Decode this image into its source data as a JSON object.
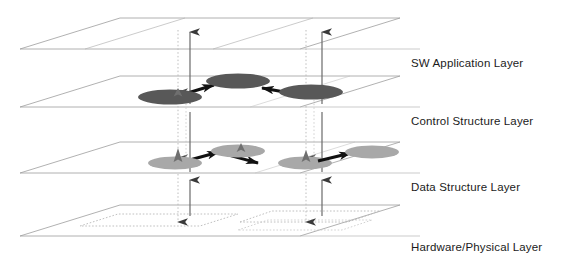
{
  "diagram": {
    "title_present": false,
    "type": "layered-architecture-3d",
    "background_color": "#ffffff",
    "plane_stroke": "#9a9a9a",
    "plane_fill": "#ffffff",
    "dotted_stroke": "#b0b0b0",
    "connector_stroke": "#4d4d4d",
    "arrow_black": "#111111",
    "control_node_color": "#585858",
    "data_node_color": "#a8a8a8",
    "layers": [
      {
        "id": "sw-application",
        "label": "SW Application Layer",
        "order": 0,
        "back_edge_y": 18,
        "front_edge_y": 49,
        "nodes": 0
      },
      {
        "id": "control-structure",
        "label": "Control Structure Layer",
        "order": 1,
        "back_edge_y": 76,
        "front_edge_y": 107,
        "nodes": 3,
        "node_color": "#585858"
      },
      {
        "id": "data-structure",
        "label": "Data Structure Layer",
        "order": 2,
        "back_edge_y": 142,
        "front_edge_y": 173,
        "nodes": 4,
        "node_color": "#a8a8a8"
      },
      {
        "id": "hardware-physical",
        "label": "Hardware/Physical  Layer",
        "order": 3,
        "back_edge_y": 205,
        "front_edge_y": 236,
        "nodes": 0,
        "dotted_regions": 2
      }
    ],
    "control_nodes": [
      {
        "id": "c1",
        "cx": 170,
        "cy": 97,
        "rx": 32,
        "ry": 7.5
      },
      {
        "id": "c2",
        "cx": 238,
        "cy": 81,
        "rx": 32,
        "ry": 7.5
      },
      {
        "id": "c3",
        "cx": 311,
        "cy": 92,
        "rx": 32,
        "ry": 7.5
      }
    ],
    "data_nodes": [
      {
        "id": "d1",
        "cx": 175,
        "cy": 163,
        "rx": 27,
        "ry": 6.5
      },
      {
        "id": "d2",
        "cx": 238,
        "cy": 151,
        "rx": 27,
        "ry": 6.5
      },
      {
        "id": "d3",
        "cx": 305,
        "cy": 163,
        "rx": 27,
        "ry": 6.5
      },
      {
        "id": "d4",
        "cx": 372,
        "cy": 152,
        "rx": 27,
        "ry": 6.5
      }
    ],
    "control_links": [
      {
        "from": "c1",
        "to": "c2",
        "style": "solid-arrow"
      },
      {
        "from": "c3",
        "to": "c2",
        "style": "solid-arrow"
      }
    ],
    "data_links": [
      {
        "from": "d1",
        "to": "d2",
        "style": "solid-arrow"
      },
      {
        "from": "d2",
        "to": "d3",
        "style": "solid-arrow"
      },
      {
        "from": "d3",
        "to": "d4",
        "style": "solid-arrow"
      }
    ],
    "vertical_connectors": [
      {
        "x": 190,
        "direction": "up",
        "style": "solid",
        "from_y": 216,
        "to_y": 32
      },
      {
        "x": 178,
        "direction": "down",
        "style": "dotted",
        "from_y": 30,
        "to_y": 222
      },
      {
        "x": 322,
        "direction": "up",
        "style": "solid",
        "from_y": 216,
        "to_y": 32
      },
      {
        "x": 306,
        "direction": "down",
        "style": "dotted",
        "from_y": 30,
        "to_y": 222
      }
    ]
  }
}
